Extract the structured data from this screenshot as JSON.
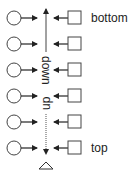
{
  "diagram": {
    "labels": {
      "bottom": "bottom",
      "top": "top",
      "down": "down",
      "up": "up"
    },
    "rows": [
      {
        "index": 1,
        "left": "circle",
        "right": "square"
      },
      {
        "index": 2,
        "left": "circle",
        "right": "square"
      },
      {
        "index": 3,
        "left": "circle",
        "right": "square"
      },
      {
        "index": 4,
        "left": "circle",
        "right": "square"
      },
      {
        "index": 5,
        "left": "circle",
        "right": "square"
      },
      {
        "index": 6,
        "left": "circle",
        "right": "square"
      }
    ],
    "icons": {
      "circle": "circle-icon",
      "square": "square-icon",
      "triangle": "triangle-icon",
      "arrow_right": "arrow-right-icon",
      "arrow_left": "arrow-left-icon",
      "arrow_up": "arrow-up-icon",
      "arrow_down": "arrow-down-icon"
    },
    "colors": {
      "stroke": "#333333",
      "fill": "#ffffff",
      "text": "#222222"
    }
  }
}
